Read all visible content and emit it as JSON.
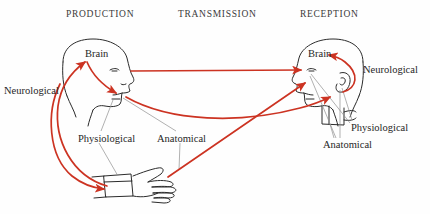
{
  "diagram": {
    "background_color": "#fefefe",
    "ink_color": "#2b2b2b",
    "arrow_color": "#cc3322",
    "leader_color": "#8c8c8c",
    "headers": [
      {
        "id": "production",
        "label": "PRODUCTION",
        "x": 66,
        "y": 9
      },
      {
        "id": "transmission",
        "label": "TRANSMISSION",
        "x": 178,
        "y": 9
      },
      {
        "id": "reception",
        "label": "RECEPTION",
        "x": 300,
        "y": 9
      }
    ],
    "labels": [
      {
        "id": "brain-left",
        "label": "Brain",
        "x": 85,
        "y": 50,
        "side": "production"
      },
      {
        "id": "brain-right",
        "label": "Brain",
        "x": 308,
        "y": 50,
        "side": "reception"
      },
      {
        "id": "neurological-left",
        "label": "Neurological",
        "x": 4,
        "y": 86,
        "side": "production"
      },
      {
        "id": "neurological-right",
        "label": "Neurological",
        "x": 363,
        "y": 66,
        "side": "reception"
      },
      {
        "id": "physiological-left",
        "label": "Physiological",
        "x": 78,
        "y": 135,
        "side": "production"
      },
      {
        "id": "anatomical-left",
        "label": "Anatomical",
        "x": 157,
        "y": 135,
        "side": "production"
      },
      {
        "id": "physiological-right",
        "label": "Physiological",
        "x": 351,
        "y": 124,
        "side": "reception"
      },
      {
        "id": "anatomical-right",
        "label": "Anatomical",
        "x": 323,
        "y": 141,
        "side": "reception"
      }
    ],
    "pathways": [
      {
        "id": "speaker-brain-to-mouth",
        "type": "neurological-outgoing",
        "from": "brain-left",
        "to": "mouth-left",
        "color": "#cc3322"
      },
      {
        "id": "speaker-hand-to-brain",
        "type": "neurological-feedback",
        "from": "hand-left",
        "to": "brain-left",
        "color": "#cc3322"
      },
      {
        "id": "speaker-brain-to-hand",
        "type": "neurological-outgoing",
        "from": "brain-left",
        "to": "hand-left",
        "color": "#cc3322"
      },
      {
        "id": "acoustic-mouth-to-ear",
        "type": "transmission-sound",
        "from": "mouth-left",
        "to": "ear-right",
        "color": "#cc3322"
      },
      {
        "id": "acoustic-mouth-to-ear-2",
        "type": "transmission-sound",
        "from": "mouth-left",
        "to": "hand-right",
        "color": "#cc3322"
      },
      {
        "id": "visual-hand-to-eye",
        "type": "transmission-light",
        "from": "hand-left",
        "to": "eye-right",
        "color": "#cc3322"
      },
      {
        "id": "listener-ear-to-brain",
        "type": "neurological-incoming",
        "from": "ear-right",
        "to": "brain-right",
        "color": "#cc3322"
      }
    ],
    "figures": [
      {
        "id": "speaker-head",
        "name": "speaker-head-profile",
        "side": "production",
        "facing": "right"
      },
      {
        "id": "speaker-hand",
        "name": "speaker-hand",
        "side": "production",
        "facing": "right"
      },
      {
        "id": "listener-head",
        "name": "listener-head-profile",
        "side": "reception",
        "facing": "left"
      },
      {
        "id": "listener-hand",
        "name": "listener-hand",
        "side": "reception",
        "facing": "left"
      }
    ]
  }
}
